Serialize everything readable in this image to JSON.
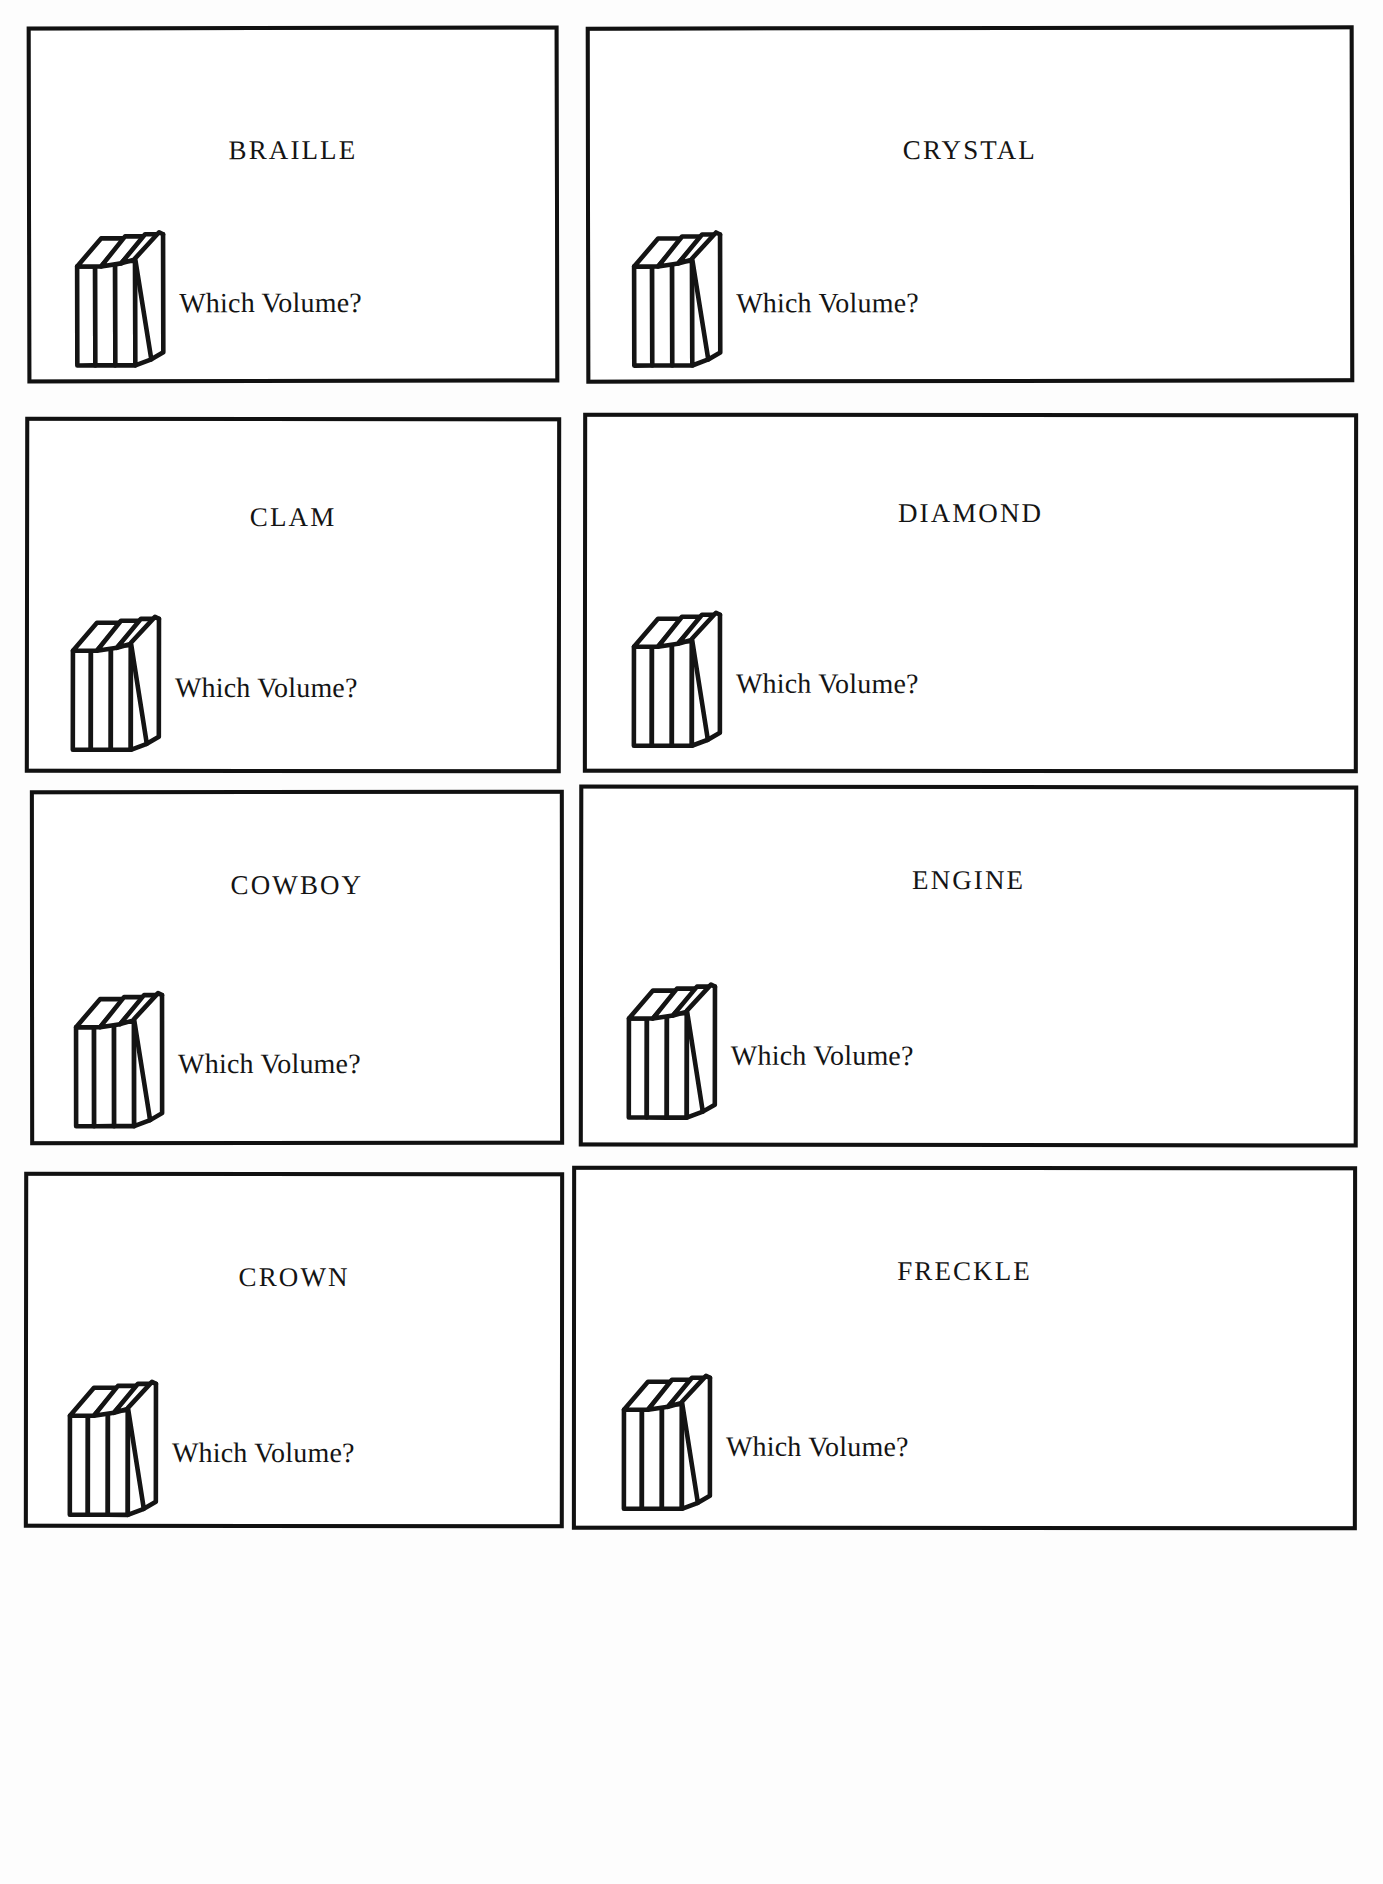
{
  "page": {
    "background_color": "#fdfdfd",
    "ink_color": "#141414",
    "layout": "2-column x 4-row grid of puzzle cards",
    "shared_prompt": "Which Volume?",
    "icon_name": "row-of-books-icon"
  },
  "cards": [
    {
      "title": "BRAILLE",
      "prompt": "Which Volume?",
      "icon": "row-of-books-icon"
    },
    {
      "title": "CRYSTAL",
      "prompt": "Which Volume?",
      "icon": "row-of-books-icon"
    },
    {
      "title": "CLAM",
      "prompt": "Which Volume?",
      "icon": "row-of-books-icon"
    },
    {
      "title": "DIAMOND",
      "prompt": "Which Volume?",
      "icon": "row-of-books-icon"
    },
    {
      "title": "COWBOY",
      "prompt": "Which Volume?",
      "icon": "row-of-books-icon"
    },
    {
      "title": "ENGINE",
      "prompt": "Which Volume?",
      "icon": "row-of-books-icon"
    },
    {
      "title": "CROWN",
      "prompt": "Which Volume?",
      "icon": "row-of-books-icon"
    },
    {
      "title": "FRECKLE",
      "prompt": "Which Volume?",
      "icon": "row-of-books-icon"
    }
  ]
}
